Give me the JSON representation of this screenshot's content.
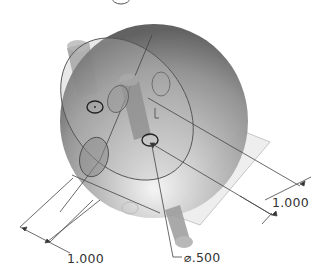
{
  "model": {
    "name": "sphere-with-cylindrical-pins",
    "body_color": "#8a8a8a",
    "highlight_color": "#f2f2f2",
    "line_color": "#3a3a3a"
  },
  "dimensions": [
    {
      "id": "dim-right",
      "label": "1.000"
    },
    {
      "id": "dim-bottom-left",
      "label": "1.000"
    },
    {
      "id": "dim-diameter",
      "label": "⌀.500"
    }
  ]
}
